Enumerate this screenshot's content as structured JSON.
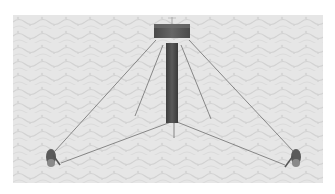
{
  "image": {
    "description": "3D rendering of a guyed mast tower with a square cap on a textured ground plane, anchored by three guy-wire sets to ground anchors",
    "colors": {
      "background": "#ffffff",
      "ground": "#e4e4e4",
      "ground_texture": "#cfcfcf",
      "tower": "#4a4a4a",
      "cap": "#555555",
      "wires": "#7a7a7a",
      "anchors": "#5a5a5a"
    }
  }
}
